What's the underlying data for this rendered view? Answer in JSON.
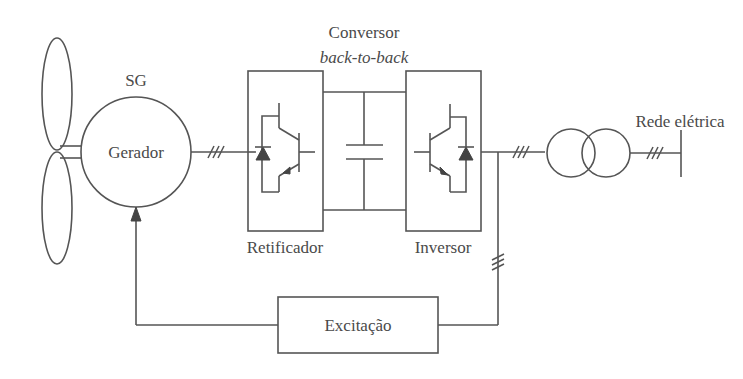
{
  "diagram": {
    "type": "block-diagram",
    "labels": {
      "generator_type": "SG",
      "generator": "Gerador",
      "converter_title": "Conversor",
      "converter_subtitle": "back-to-back",
      "rectifier": "Retificador",
      "inverter": "Inversor",
      "grid": "Rede elétrica",
      "excitation": "Excitação"
    },
    "components": [
      {
        "id": "turbine",
        "kind": "wind-turbine-blades"
      },
      {
        "id": "generator",
        "kind": "synchronous-generator",
        "label": "Gerador"
      },
      {
        "id": "rectifier",
        "kind": "igbt-diode-converter",
        "label": "Retificador"
      },
      {
        "id": "dc-link",
        "kind": "capacitor"
      },
      {
        "id": "inverter",
        "kind": "igbt-diode-converter",
        "label": "Inversor"
      },
      {
        "id": "transformer",
        "kind": "two-winding-transformer"
      },
      {
        "id": "grid",
        "kind": "busbar",
        "label": "Rede elétrica"
      },
      {
        "id": "excitation",
        "kind": "block",
        "label": "Excitação"
      }
    ],
    "connections": [
      {
        "from": "turbine",
        "to": "generator",
        "kind": "shaft"
      },
      {
        "from": "generator",
        "to": "rectifier",
        "phases": 3
      },
      {
        "from": "rectifier",
        "to": "dc-link"
      },
      {
        "from": "dc-link",
        "to": "inverter"
      },
      {
        "from": "inverter",
        "to": "transformer",
        "phases": 3
      },
      {
        "from": "transformer",
        "to": "grid",
        "phases": 3
      },
      {
        "from": "inverter",
        "to": "excitation",
        "phases": 3
      },
      {
        "from": "excitation",
        "to": "generator",
        "kind": "arrow"
      }
    ]
  }
}
